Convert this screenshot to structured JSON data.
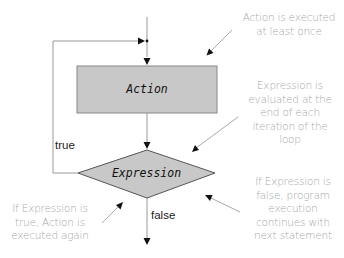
{
  "diagram": {
    "type": "flowchart",
    "nodes": {
      "action": {
        "label": "Action",
        "shape": "rectangle",
        "fill": "#c8c8c8"
      },
      "expression": {
        "label": "Expression",
        "shape": "diamond",
        "fill": "#c8c8c8"
      }
    },
    "edges": {
      "true_label": "true",
      "false_label": "false"
    },
    "annotations": {
      "top_right": "Action is executed at least once",
      "middle_right": "Expression is evaluated at the end of each iteration of the loop",
      "bottom_left": "If Expression is true, Action is executed again",
      "bottom_right": "If Expression is false, program execution continues with next statement"
    },
    "annotation_lines": {
      "top_right": [
        "Action is executed",
        "at least once"
      ],
      "middle_right": [
        "Expression is",
        "evaluated at the",
        "end of each",
        "iteration of the",
        "loop"
      ],
      "bottom_left": [
        "If Expression is",
        "true, Action is",
        "executed again"
      ],
      "bottom_right": [
        "If Expression is",
        "false, program",
        "execution",
        "continues with",
        "next statement"
      ]
    },
    "colors": {
      "line": "#888888",
      "node_fill": "#c8c8c8",
      "node_stroke": "#777777",
      "note_text": "#a8a8a8",
      "arrowhead": "#111111"
    }
  }
}
